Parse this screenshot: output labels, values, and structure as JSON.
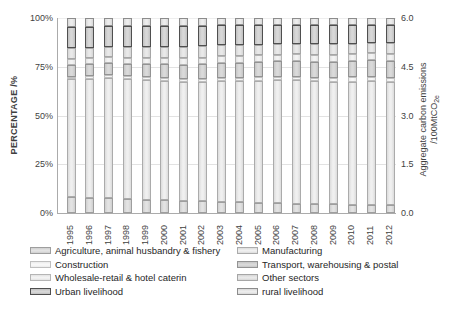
{
  "figure": {
    "left_axis": {
      "title": "PERCENTAGE /%",
      "ticks": [
        "100%",
        "75%",
        "50%",
        "25%",
        "0%"
      ]
    },
    "right_axis": {
      "title_line1": "Aggregate carbon emissions",
      "title_line2_prefix": "/100MtCO",
      "title_line2_sub": "2e",
      "ticks": [
        "6.0",
        "4.5",
        "3.0",
        "1.5",
        "0.0"
      ]
    }
  },
  "chart_data": {
    "type": "bar",
    "stacked": true,
    "stacking": "percent",
    "title": "",
    "xlabel": "",
    "ylabel_left": "PERCENTAGE /%",
    "ylabel_right": "Aggregate carbon emissions /100MtCO2e",
    "ylim_left": [
      0,
      100
    ],
    "ylim_right": [
      0.0,
      6.0
    ],
    "grid": "horizontal gridlines at 25%, 50%, 75%, 100%",
    "legend_position": "bottom, two columns",
    "categories": [
      "1995",
      "1996",
      "1997",
      "1998",
      "1999",
      "2000",
      "2001",
      "2002",
      "2003",
      "2004",
      "2005",
      "2006",
      "2007",
      "2008",
      "2009",
      "2010",
      "2011",
      "2012"
    ],
    "series": [
      {
        "name": "Agriculture, animal husbandry & fishery",
        "fill": "#cfcfcf",
        "highlight": "#e3e3e3",
        "edge": "#9e9e9e",
        "values": [
          8.0,
          7.8,
          7.5,
          7.2,
          6.8,
          6.5,
          6.2,
          6.0,
          5.7,
          5.4,
          5.1,
          4.9,
          4.7,
          4.5,
          4.4,
          4.2,
          4.1,
          4.0
        ]
      },
      {
        "name": "Manufacturing",
        "fill": "#dcdcdc",
        "highlight": "#f0f0f0",
        "edge": "#ababab",
        "values": [
          60.5,
          61.0,
          61.8,
          61.5,
          61.2,
          61.0,
          60.8,
          61.0,
          61.8,
          62.3,
          62.8,
          63.2,
          63.4,
          63.0,
          63.0,
          63.2,
          63.6,
          63.2
        ]
      },
      {
        "name": "Construction",
        "fill": "#ebebeb",
        "highlight": "#f8f8f8",
        "edge": "#bfbfbf",
        "values": [
          1.5,
          1.5,
          1.5,
          1.6,
          1.7,
          1.7,
          1.8,
          1.8,
          1.8,
          1.8,
          1.8,
          1.8,
          1.8,
          1.9,
          2.0,
          2.1,
          2.2,
          2.2
        ]
      },
      {
        "name": "Transport, warehousing & postal",
        "fill": "#c6c6c6",
        "highlight": "#dadada",
        "edge": "#939393",
        "values": [
          6.0,
          6.0,
          6.1,
          6.3,
          6.6,
          7.0,
          7.3,
          7.5,
          7.6,
          7.7,
          7.8,
          7.9,
          8.0,
          8.2,
          8.2,
          8.4,
          8.5,
          8.7
        ]
      },
      {
        "name": "Wholesale-retail & hotel caterin",
        "fill": "#e3e3e3",
        "highlight": "#f3f3f3",
        "edge": "#b5b5b5",
        "values": [
          3.0,
          3.0,
          3.0,
          3.1,
          3.2,
          3.3,
          3.4,
          3.4,
          3.4,
          3.4,
          3.4,
          3.4,
          3.5,
          3.6,
          3.6,
          3.6,
          3.6,
          3.7
        ]
      },
      {
        "name": "Other sectors",
        "fill": "#d6d6d6",
        "highlight": "#e9e9e9",
        "edge": "#a6a6a6",
        "values": [
          5.5,
          5.5,
          5.4,
          5.5,
          5.6,
          5.7,
          5.8,
          5.8,
          5.7,
          5.6,
          5.5,
          5.4,
          5.4,
          5.5,
          5.5,
          5.4,
          5.3,
          5.4
        ]
      },
      {
        "name": "Urban  livelihood",
        "fill": "#c0c0c0",
        "highlight": "#d8d8d8",
        "edge": "#4f4f4f",
        "values": [
          11.0,
          10.8,
          10.5,
          10.6,
          10.7,
          10.7,
          10.7,
          10.5,
          10.2,
          10.0,
          9.9,
          9.7,
          9.6,
          9.7,
          9.7,
          9.6,
          9.3,
          9.4
        ]
      },
      {
        "name": "rural livelihood",
        "fill": "#d9d9d9",
        "highlight": "#ededed",
        "edge": "#8c8c8c",
        "values": [
          4.5,
          4.4,
          4.2,
          4.2,
          4.2,
          4.1,
          4.0,
          4.0,
          3.8,
          3.8,
          3.7,
          3.7,
          3.6,
          3.6,
          3.6,
          3.5,
          3.4,
          3.4
        ]
      }
    ],
    "legend_columns": [
      [
        0,
        2,
        4,
        6
      ],
      [
        1,
        3,
        5,
        7
      ]
    ]
  }
}
